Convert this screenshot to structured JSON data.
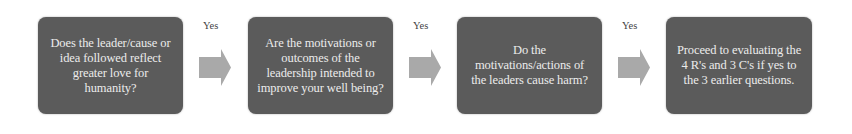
{
  "diagram": {
    "type": "flowchart",
    "direction": "left-to-right",
    "colors": {
      "box_fill": "#5b5b5b",
      "box_text": "#ececec",
      "arrow_fill": "#a9a9a9",
      "label_text": "#444444",
      "background": "#ffffff"
    },
    "steps": [
      {
        "text": "Does the leader/cause or idea followed reflect greater love for humanity?"
      },
      {
        "text": "Are the motivations or outcomes of the leadership intended to improve your well being?"
      },
      {
        "text": "Do the motivations/actions of the leaders cause harm?"
      },
      {
        "text": "Proceed to evaluating the 4 R's and 3 C's if yes to the 3 earlier questions."
      }
    ],
    "connectors": [
      {
        "label": "Yes",
        "icon": "right-arrow-icon"
      },
      {
        "label": "Yes",
        "icon": "right-arrow-icon"
      },
      {
        "label": "Yes",
        "icon": "right-arrow-icon"
      }
    ]
  }
}
